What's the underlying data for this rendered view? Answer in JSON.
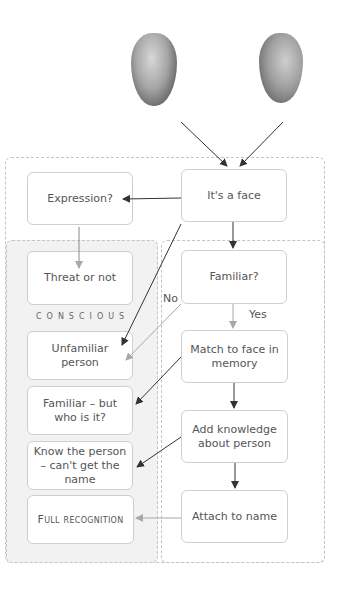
{
  "figure": {
    "images": [
      {
        "name": "front-view-face",
        "description": "grayscale 3D face, frontal view"
      },
      {
        "name": "side-view-face",
        "description": "grayscale 3D face, profile view"
      }
    ],
    "regions": {
      "conscious_label": "CONSCIOUS"
    },
    "nodes": {
      "its_a_face": "It's a face",
      "expression": "Expression?",
      "threat": "Threat or not",
      "familiar_q": "Familiar?",
      "unfamiliar": "Unfamiliar person",
      "match": "Match to face in memory",
      "familiar_but": "Familiar – but who is it?",
      "add_knowledge": "Add knowledge about person",
      "know_person": "Know the person – can't get the name",
      "attach_name": "Attach to name",
      "full_recognition": "Full recognition"
    },
    "edge_labels": {
      "no": "No",
      "yes": "Yes"
    },
    "colors": {
      "arrow_dark": "#333333",
      "arrow_light": "#a8a8a8",
      "conscious_fill": "#f2f2f2",
      "box_border": "#cfcfcf",
      "dashed_border": "#c4c4c4"
    }
  }
}
